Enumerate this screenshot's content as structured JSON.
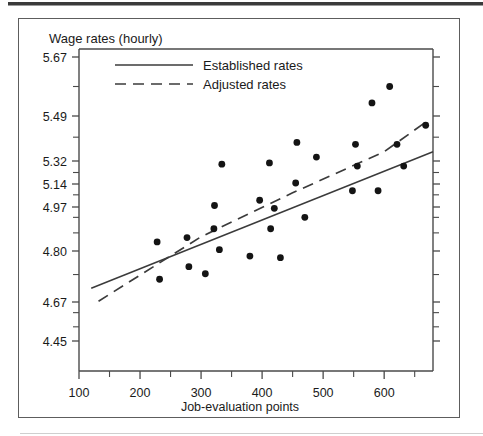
{
  "figure": {
    "title": "Wage rates (hourly)",
    "frame_color": "#5d5d5d",
    "background": "#ffffff"
  },
  "legend": {
    "position": "top-left-inside",
    "entries": [
      {
        "label": "Established rates",
        "style": "solid",
        "color": "#3b3b3b"
      },
      {
        "label": "Adjusted rates",
        "style": "dashed",
        "color": "#3b3b3b"
      }
    ]
  },
  "chart_data": {
    "type": "scatter",
    "title": "Wage rates (hourly)",
    "xlabel": "Job-evaluation points",
    "ylabel": "Wage rates (hourly)",
    "grid": false,
    "xlim": [
      100,
      680
    ],
    "ylim": [
      4.38,
      5.76
    ],
    "xticks": [
      100,
      200,
      300,
      400,
      500,
      600
    ],
    "xtick_labels": [
      "100",
      "200",
      "300",
      "400",
      "500",
      "600"
    ],
    "x_minor_ticks": [
      150,
      250,
      350,
      450,
      550,
      650
    ],
    "yticks": [
      4.45,
      4.67,
      4.8,
      4.97,
      5.14,
      5.32,
      5.49,
      5.67
    ],
    "ytick_labels": [
      "4.45",
      "4.67",
      "4.80",
      "4.97",
      "5.14",
      "5.32",
      "5.49",
      "5.67"
    ],
    "y_minor_ticks": [
      4.53,
      4.61,
      4.74,
      4.87,
      4.93,
      5.06,
      5.23,
      5.41,
      5.58
    ],
    "point_color": "#141414",
    "point_radius_px": 3.4,
    "points": [
      {
        "x": 228,
        "y": 4.835
      },
      {
        "x": 232,
        "y": 4.728
      },
      {
        "x": 277,
        "y": 4.852
      },
      {
        "x": 280,
        "y": 4.76
      },
      {
        "x": 307,
        "y": 4.742
      },
      {
        "x": 321,
        "y": 4.886
      },
      {
        "x": 322,
        "y": 4.981
      },
      {
        "x": 330,
        "y": 4.805
      },
      {
        "x": 334,
        "y": 5.295
      },
      {
        "x": 380,
        "y": 4.787
      },
      {
        "x": 396,
        "y": 5.02
      },
      {
        "x": 412,
        "y": 5.305
      },
      {
        "x": 414,
        "y": 4.886
      },
      {
        "x": 420,
        "y": 4.965
      },
      {
        "x": 430,
        "y": 4.783
      },
      {
        "x": 455,
        "y": 5.148
      },
      {
        "x": 457,
        "y": 5.39
      },
      {
        "x": 470,
        "y": 4.93
      },
      {
        "x": 489,
        "y": 5.335
      },
      {
        "x": 548,
        "y": 5.09
      },
      {
        "x": 553,
        "y": 5.383
      },
      {
        "x": 556,
        "y": 5.28
      },
      {
        "x": 580,
        "y": 5.53
      },
      {
        "x": 590,
        "y": 5.09
      },
      {
        "x": 609,
        "y": 5.58
      },
      {
        "x": 621,
        "y": 5.383
      },
      {
        "x": 632,
        "y": 5.28
      },
      {
        "x": 668,
        "y": 5.455
      }
    ],
    "series": [
      {
        "name": "Established rates",
        "style": "solid",
        "color": "#3b3b3b",
        "x": [
          120,
          680
        ],
        "y": [
          4.705,
          5.355
        ]
      },
      {
        "name": "Adjusted rates",
        "style": "dashed",
        "color": "#3b3b3b",
        "x": [
          132,
          300,
          450,
          600,
          670
        ],
        "y": [
          4.672,
          4.855,
          5.075,
          5.355,
          5.47
        ]
      }
    ]
  }
}
